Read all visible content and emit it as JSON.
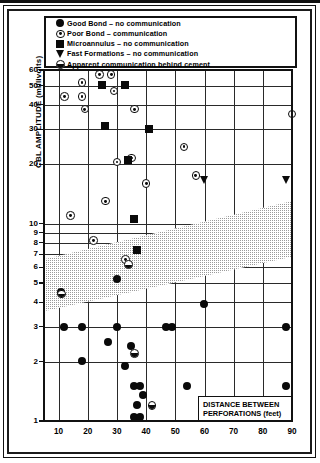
{
  "chart_data": {
    "type": "scatter",
    "title": "",
    "xlabel": "DISTANCE BETWEEN PERFORATIONS (feet)",
    "ylabel": "CBL AMPLITUDE (millivolts)",
    "xscale": "linear",
    "yscale": "log",
    "xlim": [
      5,
      90
    ],
    "ylim": [
      1,
      60
    ],
    "grid": true,
    "xticks": [
      10,
      20,
      30,
      40,
      50,
      60,
      70,
      80,
      90
    ],
    "yticks": [
      1,
      2,
      3,
      4,
      5,
      6,
      7,
      8,
      9,
      10,
      20,
      30,
      40,
      50,
      60
    ],
    "ytick_labels": [
      "1",
      "2",
      "3",
      "4",
      "5",
      "6",
      "7",
      "8",
      "9",
      "10",
      "20",
      "30",
      "40",
      "50",
      "60"
    ],
    "legend_position": "top",
    "legend": [
      {
        "marker": "filled-circle",
        "label": "Good Bond – no communication"
      },
      {
        "marker": "circle-dot",
        "label": "Poor Bond – communication"
      },
      {
        "marker": "filled-square",
        "label": "Microannulus – no communication"
      },
      {
        "marker": "down-triangle",
        "label": "Fast Formations – no communication"
      },
      {
        "marker": "half-filled-circle",
        "label": "Apparent communication behind cement"
      }
    ],
    "annotations": [
      {
        "text": "shaded transition band",
        "type": "wedge",
        "x_start": 5,
        "x_end": 90,
        "y_lower_start": 3.6,
        "y_upper_start": 6.6,
        "y_lower_end": 6.8,
        "y_upper_end": 13.0
      }
    ],
    "series": [
      {
        "name": "Good Bond – no communication",
        "marker": "filled-circle",
        "points": [
          [
            11,
            4.5
          ],
          [
            12,
            3.0
          ],
          [
            18,
            3.0
          ],
          [
            18,
            2.0
          ],
          [
            27,
            2.5
          ],
          [
            30,
            5.2
          ],
          [
            30,
            3.0
          ],
          [
            33,
            1.9
          ],
          [
            35,
            2.4
          ],
          [
            36,
            1.5
          ],
          [
            36,
            1.05
          ],
          [
            37,
            1.2
          ],
          [
            38,
            1.5
          ],
          [
            38,
            1.05
          ],
          [
            39,
            1.35
          ],
          [
            47,
            3.0
          ],
          [
            49,
            3.0
          ],
          [
            54,
            1.5
          ],
          [
            60,
            3.9
          ],
          [
            88,
            3.0
          ],
          [
            88,
            1.5
          ]
        ]
      },
      {
        "name": "Poor Bond – communication",
        "marker": "circle-dot",
        "points": [
          [
            12,
            44
          ],
          [
            14,
            11
          ],
          [
            18,
            44
          ],
          [
            18,
            52
          ],
          [
            19,
            38
          ],
          [
            22,
            8.2
          ],
          [
            24,
            57
          ],
          [
            26,
            13.0
          ],
          [
            28,
            57
          ],
          [
            29,
            47
          ],
          [
            30,
            20.5
          ],
          [
            33,
            6.6
          ],
          [
            35,
            21.5
          ],
          [
            36,
            38
          ],
          [
            40,
            16.0
          ],
          [
            53,
            24.5
          ],
          [
            57,
            17.5
          ],
          [
            90,
            36
          ]
        ]
      },
      {
        "name": "Microannulus – no communication",
        "marker": "filled-square",
        "points": [
          [
            25,
            50
          ],
          [
            26,
            31
          ],
          [
            33,
            50
          ],
          [
            34,
            21
          ],
          [
            36,
            10.5
          ],
          [
            37,
            7.3
          ],
          [
            41,
            30
          ]
        ]
      },
      {
        "name": "Fast Formations – no communication",
        "marker": "down-triangle",
        "points": [
          [
            60,
            16.5
          ],
          [
            88,
            16.5
          ]
        ]
      },
      {
        "name": "Apparent communication behind cement",
        "marker": "half-filled-circle",
        "points": [
          [
            11,
            4.4
          ],
          [
            34,
            6.2
          ],
          [
            36,
            2.2
          ],
          [
            42,
            1.2
          ]
        ]
      }
    ]
  },
  "axes": {
    "y_label": "CBL AMPLITUDE (millivolts)",
    "x_label_line1": "DISTANCE BETWEEN",
    "x_label_line2": "PERFORATIONS (feet)"
  },
  "colors": {
    "marker": "#0a0a0a",
    "grid": "#2a2a2a",
    "band": "#cccccc",
    "frame": "#111111",
    "background": "#ffffff"
  }
}
